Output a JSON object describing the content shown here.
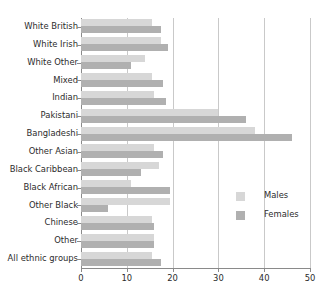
{
  "chart_data": {
    "type": "bar",
    "orientation": "horizontal",
    "title": "",
    "subtitle": "",
    "xlabel": "",
    "ylabel": "",
    "xlim": [
      0,
      50
    ],
    "xticks": [
      0,
      10,
      20,
      30,
      40,
      50
    ],
    "xticklabels": [
      "0",
      "10",
      "20",
      "30",
      "40",
      "50"
    ],
    "grid": true,
    "grid_axis": "x",
    "legend_position": "right",
    "categories": [
      "White British",
      "White Irish",
      "White Other",
      "Mixed",
      "Indian",
      "Pakistani",
      "Bangladeshi",
      "Other Asian",
      "Black Caribbean",
      "Black African",
      "Other Black",
      "Chinese",
      "Other",
      "All ethnic groups"
    ],
    "series": [
      {
        "name": "Males",
        "color": "#d7d7d7",
        "values": [
          15.5,
          17.5,
          14.0,
          15.5,
          16.0,
          30.0,
          38.0,
          16.0,
          17.0,
          11.0,
          19.5,
          15.5,
          16.0,
          15.5
        ]
      },
      {
        "name": "Females",
        "color": "#b0b0b0",
        "values": [
          17.5,
          19.0,
          11.0,
          18.0,
          18.5,
          36.0,
          46.0,
          18.0,
          13.0,
          19.5,
          6.0,
          16.0,
          16.0,
          17.5
        ]
      }
    ]
  },
  "legend": {
    "entries": [
      {
        "label": "Males"
      },
      {
        "label": "Females"
      }
    ]
  },
  "colors": {
    "males": "#d7d7d7",
    "females": "#b0b0b0",
    "grid": "#c9c9c9",
    "axis": "#8a8a8a",
    "text": "#2b2b2b",
    "background": "#ffffff"
  }
}
